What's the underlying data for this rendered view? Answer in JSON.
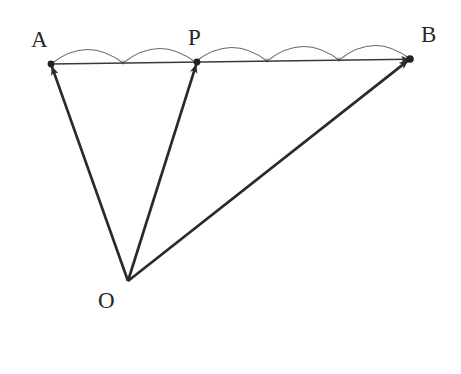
{
  "figure": {
    "type": "vector-geometry-diagram",
    "background_color": "#ffffff",
    "stroke_color": "#2a2a2a",
    "arc_color": "#6a6a6a",
    "baseline_color": "#3a3a3a",
    "label_color": "#262626",
    "width": 461,
    "height": 374
  },
  "points": {
    "A": {
      "label": "A",
      "x": 51,
      "y": 64,
      "label_x": 31,
      "label_y": 28
    },
    "P": {
      "label": "P",
      "x": 197,
      "y": 62,
      "label_x": 188,
      "label_y": 26
    },
    "B": {
      "label": "B",
      "x": 410,
      "y": 59,
      "label_x": 421,
      "label_y": 23
    },
    "O": {
      "label": "O",
      "x": 128,
      "y": 281,
      "label_x": 98,
      "label_y": 289
    }
  },
  "segment_ab": {
    "from": "A",
    "to": "B",
    "divisions": 5,
    "arrow_at": "B",
    "tick_x": [
      51,
      123,
      195,
      267,
      339,
      410
    ],
    "tick_y": [
      64,
      63,
      62,
      61,
      60,
      59
    ]
  },
  "arcs": [
    {
      "name": "arc-1",
      "from_x": 51,
      "to_x": 123,
      "rise": 14
    },
    {
      "name": "arc-2",
      "from_x": 123,
      "to_x": 195,
      "rise": 14
    },
    {
      "name": "arc-3",
      "from_x": 195,
      "to_x": 267,
      "rise": 14
    },
    {
      "name": "arc-4",
      "from_x": 267,
      "to_x": 339,
      "rise": 14
    },
    {
      "name": "arc-5",
      "from_x": 339,
      "to_x": 410,
      "rise": 14
    }
  ],
  "vectors": [
    {
      "name": "vector-oa",
      "from": "O",
      "to": "A",
      "x1": 128,
      "y1": 281,
      "x2": 51,
      "y2": 64,
      "arrow_at": "A"
    },
    {
      "name": "vector-op",
      "from": "O",
      "to": "P",
      "x1": 128,
      "y1": 281,
      "x2": 197,
      "y2": 62,
      "arrow_at": "P"
    },
    {
      "name": "vector-ob",
      "from": "O",
      "to": "B",
      "x1": 128,
      "y1": 281,
      "x2": 410,
      "y2": 59,
      "arrow_at": "B"
    }
  ],
  "dots": [
    {
      "name": "dot-a",
      "x": 51,
      "y": 64,
      "r": 3.4
    },
    {
      "name": "dot-p",
      "x": 197,
      "y": 62,
      "r": 3.4
    },
    {
      "name": "dot-b",
      "x": 410,
      "y": 59,
      "r": 3.8
    }
  ]
}
